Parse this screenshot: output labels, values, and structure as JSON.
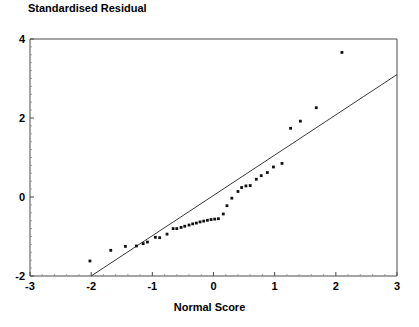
{
  "chart_data": {
    "type": "scatter",
    "title": "Standardised Residual",
    "xlabel": "Normal Score",
    "ylabel": "Standardised Residual",
    "xlim": [
      -3,
      3
    ],
    "ylim": [
      -2,
      4
    ],
    "xticks": [
      -3,
      -2,
      -1,
      0,
      1,
      2,
      3
    ],
    "xticklabels": [
      "-3",
      "-2",
      "-1",
      "0",
      "1",
      "2",
      "3"
    ],
    "yticks": [
      -2,
      0,
      2,
      4
    ],
    "yticklabels": [
      "-2",
      "0",
      "2",
      "4"
    ],
    "grid": false,
    "legend": null,
    "series": [
      {
        "name": "Standardised residuals vs normal scores",
        "marker": "square-dot",
        "points": [
          [
            -2.02,
            -1.62
          ],
          [
            -1.68,
            -1.35
          ],
          [
            -1.44,
            -1.25
          ],
          [
            -1.26,
            -1.24
          ],
          [
            -1.15,
            -1.18
          ],
          [
            -1.08,
            -1.14
          ],
          [
            -0.95,
            -1.02
          ],
          [
            -0.88,
            -1.03
          ],
          [
            -0.76,
            -0.94
          ],
          [
            -0.66,
            -0.8
          ],
          [
            -0.6,
            -0.8
          ],
          [
            -0.53,
            -0.77
          ],
          [
            -0.47,
            -0.74
          ],
          [
            -0.4,
            -0.71
          ],
          [
            -0.34,
            -0.68
          ],
          [
            -0.28,
            -0.66
          ],
          [
            -0.22,
            -0.63
          ],
          [
            -0.16,
            -0.61
          ],
          [
            -0.1,
            -0.59
          ],
          [
            -0.04,
            -0.57
          ],
          [
            0.02,
            -0.56
          ],
          [
            0.08,
            -0.55
          ],
          [
            0.16,
            -0.43
          ],
          [
            0.22,
            -0.22
          ],
          [
            0.3,
            -0.03
          ],
          [
            0.4,
            0.14
          ],
          [
            0.46,
            0.24
          ],
          [
            0.53,
            0.28
          ],
          [
            0.6,
            0.29
          ],
          [
            0.7,
            0.45
          ],
          [
            0.78,
            0.54
          ],
          [
            0.88,
            0.62
          ],
          [
            0.98,
            0.76
          ],
          [
            1.12,
            0.85
          ],
          [
            1.26,
            1.74
          ],
          [
            1.42,
            1.92
          ],
          [
            1.68,
            2.26
          ],
          [
            2.1,
            3.66
          ]
        ]
      }
    ],
    "reference_line": {
      "name": "45-degree reference line",
      "x": [
        -2.0,
        3.0
      ],
      "y": [
        -2.0,
        3.1
      ]
    }
  },
  "colors": {
    "marker": "#111111",
    "line": "#3a3a3a",
    "axis": "#4a4a4a",
    "background": "#ffffff"
  }
}
